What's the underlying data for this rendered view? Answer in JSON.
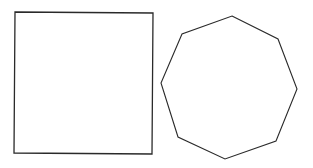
{
  "diagram": {
    "stroke_color": "#2a2a2a",
    "background": "#ffffff",
    "shapes": [
      {
        "type": "square",
        "points": "15,12 153,13 152,154 14,153"
      },
      {
        "type": "octagon",
        "points": "232,16 278,39 297,89 276,141 225,159 178,137 161,83 182,34"
      }
    ]
  }
}
